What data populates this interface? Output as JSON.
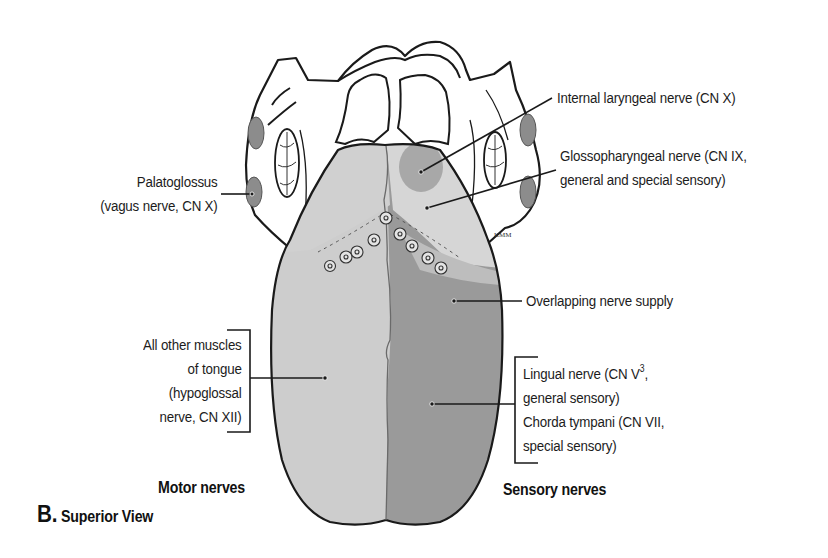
{
  "figure": {
    "panel_letter": "B.",
    "panel_title": "Superior View",
    "artist_signature": "KMM"
  },
  "labels": {
    "palatoglossus": [
      "Palatoglossus",
      "(vagus nerve, CN X)"
    ],
    "internal_laryngeal": "Internal laryngeal nerve (CN X)",
    "glossopharyngeal": [
      "Glossopharyngeal nerve (CN IX,",
      "general and special sensory)"
    ],
    "overlapping": "Overlapping nerve supply",
    "other_muscles": [
      "All other muscles",
      "of tongue",
      "(hypoglossal",
      "nerve, CN XII)"
    ],
    "lingual": {
      "line1_prefix": "Lingual nerve (CN V",
      "line1_sup": "3",
      "line1_suffix": ",",
      "line2": "general sensory)"
    },
    "chorda_tympani": [
      "Chorda tympani (CN VII,",
      "special sensory)"
    ]
  },
  "sections": {
    "motor": "Motor nerves",
    "sensory": "Sensory nerves"
  },
  "colors": {
    "outline": "#1a1a1a",
    "motor_half": "#cdcdcd",
    "sensory_half": "#9a9a9a",
    "posterior_region": "#d6d6d6",
    "internal_laryngeal_area": "#a8a8a8",
    "tonsil": "#8c8c8c"
  }
}
